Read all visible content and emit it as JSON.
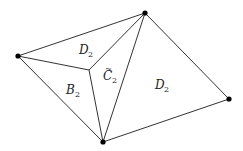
{
  "diagram": {
    "vertices": [
      {
        "id": "left",
        "x": 18,
        "y": 56
      },
      {
        "id": "top",
        "x": 145,
        "y": 13
      },
      {
        "id": "right",
        "x": 229,
        "y": 99
      },
      {
        "id": "bottom",
        "x": 103,
        "y": 142
      },
      {
        "id": "inner",
        "x": 89,
        "y": 70,
        "dot": false
      }
    ],
    "edges": [
      [
        "left",
        "top"
      ],
      [
        "top",
        "right"
      ],
      [
        "right",
        "bottom"
      ],
      [
        "bottom",
        "left"
      ],
      [
        "left",
        "inner"
      ],
      [
        "inner",
        "top"
      ],
      [
        "inner",
        "bottom"
      ],
      [
        "top",
        "bottom"
      ]
    ],
    "regions": [
      {
        "letter": "D",
        "sub": "2",
        "accent": "",
        "x": 79,
        "y": 54
      },
      {
        "letter": "C",
        "sub": "2",
        "accent": "~",
        "x": 103,
        "y": 80
      },
      {
        "letter": "B",
        "sub": "2",
        "accent": "",
        "x": 66,
        "y": 94
      },
      {
        "letter": "D",
        "sub": "2",
        "accent": "",
        "x": 155,
        "y": 89
      }
    ]
  }
}
